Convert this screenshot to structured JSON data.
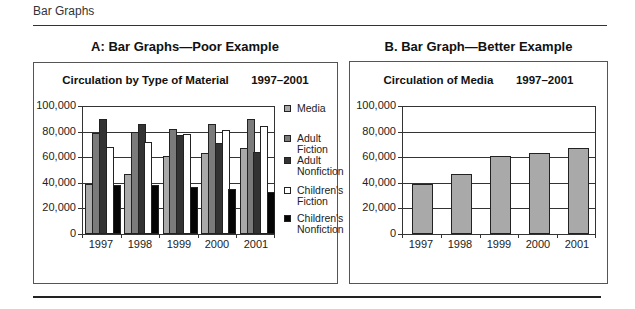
{
  "page": {
    "header": "Bar Graphs"
  },
  "panels": {
    "a": {
      "title": "A: Bar Graphs—Poor Example"
    },
    "b": {
      "title": "B. Bar Graph—Better Example"
    }
  },
  "colors": {
    "media": "#a9a9a9",
    "adult_fiction": "#7b7b7b",
    "adult_nonfiction": "#333333",
    "childrens_fiction": "#ffffff",
    "childrens_nonfiction": "#050505"
  },
  "chart_data": [
    {
      "type": "bar",
      "title": "Circulation by Type of Material   1997–2001",
      "title_parts": [
        "Circulation by Type of Material",
        "1997–2001"
      ],
      "xlabel": "",
      "ylabel": "",
      "categories": [
        "1997",
        "1998",
        "1999",
        "2000",
        "2001"
      ],
      "ylim": [
        0,
        100000
      ],
      "yticks": [
        "100,000",
        "80,000",
        "60,000",
        "40,000",
        "20,000",
        "0"
      ],
      "grid": true,
      "legend_position": "right",
      "series": [
        {
          "name": "Media",
          "color": "#a9a9a9",
          "values": [
            39000,
            47000,
            61000,
            63000,
            67000
          ]
        },
        {
          "name": "Adult Fiction",
          "color": "#7b7b7b",
          "values": [
            79000,
            80000,
            82000,
            86000,
            90000
          ]
        },
        {
          "name": "Adult Nonfiction",
          "color": "#333333",
          "values": [
            90000,
            86000,
            77000,
            71000,
            64000
          ]
        },
        {
          "name": "Children's Fiction",
          "color": "#ffffff",
          "values": [
            68000,
            72000,
            78000,
            81000,
            84000
          ]
        },
        {
          "name": "Children's Nonfiction",
          "color": "#050505",
          "values": [
            38000,
            38000,
            37000,
            35000,
            33000
          ]
        }
      ],
      "legend": [
        "Media",
        "Adult Fiction",
        "Adult Nonfiction",
        "Children's Fiction",
        "Children's Nonfiction"
      ],
      "legend_lines": [
        [
          "Media"
        ],
        [
          "Adult",
          "Fiction"
        ],
        [
          "Adult",
          "Nonfiction"
        ],
        [
          "Children's",
          "Fiction"
        ],
        [
          "Children's",
          "Nonfiction"
        ]
      ]
    },
    {
      "type": "bar",
      "title": "Circulation of Media   1997–2001",
      "title_parts": [
        "Circulation of Media",
        "1997–2001"
      ],
      "xlabel": "",
      "ylabel": "",
      "categories": [
        "1997",
        "1998",
        "1999",
        "2000",
        "2001"
      ],
      "ylim": [
        0,
        100000
      ],
      "yticks": [
        "100,000",
        "80,000",
        "60,000",
        "40,000",
        "20,000",
        "0"
      ],
      "grid": true,
      "legend_position": "none",
      "series": [
        {
          "name": "Media",
          "color": "#a9a9a9",
          "values": [
            39000,
            47000,
            61000,
            63000,
            67000
          ]
        }
      ]
    }
  ]
}
